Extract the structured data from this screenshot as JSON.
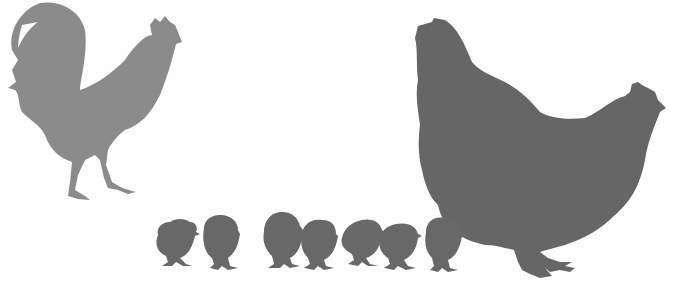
{
  "scene": {
    "description": "Silhouettes of a rooster, a hen and seven chicks",
    "background": "#fefefe",
    "rooster": {
      "color": "#8b8b8b"
    },
    "hen": {
      "color": "#666666"
    },
    "chicks": {
      "count": 7,
      "color": "#686868"
    }
  }
}
